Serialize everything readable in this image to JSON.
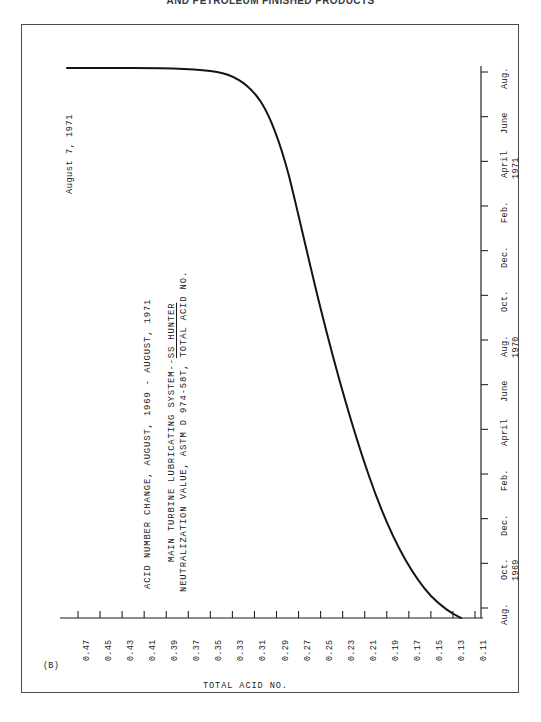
{
  "document": {
    "header": "AND PETROLEUM FINISHED PRODUCTS",
    "frame_color": "#4b4b53"
  },
  "figure": {
    "corner_code": "(B)",
    "annotation": "August 7, 1971",
    "title_lines": [
      "ACID NUMBER CHANGE, AUGUST, 1969 - AUGUST, 1971",
      "MAIN TURBINE LUBRICATING SYSTEM--SS HUNTER",
      "NEUTRALIZATION VALUE, ASTM D 974-58T, TOTAL ACID NO."
    ],
    "title_underlined_segment": "SS HUNTER",
    "value_axis_label": "TOTAL ACID NO.",
    "curve_color": "#141414",
    "axis_color": "#1b1b1b"
  },
  "chart_data": {
    "type": "line",
    "title": "ACID NUMBER CHANGE, AUGUST, 1969 - AUGUST, 1971",
    "subtitle": "MAIN TURBINE LUBRICATING SYSTEM--SS HUNTER",
    "method": "NEUTRALIZATION VALUE, ASTM D 974-58T, TOTAL ACID NO.",
    "orientation": "rotated-landscape",
    "xlabel": "TOTAL ACID NO.",
    "ylabel": "",
    "grid": false,
    "legend": null,
    "value_axis": {
      "name": "TOTAL ACID NO.",
      "ticks": [
        "0.47",
        "0.45",
        "0.43",
        "0.41",
        "0.39",
        "0.37",
        "0.35",
        "0.33",
        "0.31",
        "0.29",
        "0.27",
        "0.25",
        "0.23",
        "0.21",
        "0.19",
        "0.17",
        "0.15",
        "0.13",
        "0.11"
      ],
      "min": 0.11,
      "max": 0.47,
      "step": 0.02,
      "direction": "decreasing-left-to-right"
    },
    "time_axis": {
      "name": "Date",
      "ticks": [
        "Aug.",
        "Oct.",
        "Dec.",
        "Feb.",
        "April",
        "June",
        "Aug.",
        "Oct.",
        "Dec.",
        "Feb.",
        "April",
        "June",
        "Aug."
      ],
      "year_markers": [
        {
          "label": "1969",
          "at_tick": "Oct."
        },
        {
          "label": "1970",
          "at_tick": "Aug."
        },
        {
          "label": "1971",
          "at_tick": "April"
        }
      ],
      "start": "Aug. 1969",
      "end": "Aug. 1971",
      "direction": "bottom-to-top"
    },
    "series": [
      {
        "name": "Total Acid No.",
        "points": [
          {
            "date": "Aug. 1969",
            "value": 0.11
          },
          {
            "date": "Oct. 1969",
            "value": 0.13
          },
          {
            "date": "Dec. 1969",
            "value": 0.145
          },
          {
            "date": "Feb. 1970",
            "value": 0.16
          },
          {
            "date": "April 1970",
            "value": 0.175
          },
          {
            "date": "June 1970",
            "value": 0.195
          },
          {
            "date": "Aug. 1970",
            "value": 0.215
          },
          {
            "date": "Oct. 1970",
            "value": 0.235
          },
          {
            "date": "Dec. 1970",
            "value": 0.255
          },
          {
            "date": "Feb. 1971",
            "value": 0.28
          },
          {
            "date": "April 1971",
            "value": 0.315
          },
          {
            "date": "June 1971",
            "value": 0.4
          },
          {
            "date": "Aug. 1971",
            "value": 0.455
          },
          {
            "date": "Aug. 7, 1971",
            "value": 0.465
          }
        ],
        "annotation": "August 7, 1971"
      }
    ]
  },
  "ticks": {
    "values": [
      "0.47",
      "0.45",
      "0.43",
      "0.41",
      "0.39",
      "0.37",
      "0.35",
      "0.33",
      "0.31",
      "0.29",
      "0.27",
      "0.25",
      "0.23",
      "0.21",
      "0.19",
      "0.17",
      "0.15",
      "0.13",
      "0.11"
    ],
    "dates": [
      "Aug.",
      "Oct.",
      "Dec.",
      "Feb.",
      "April",
      "June",
      "Aug.",
      "Oct.",
      "Dec.",
      "Feb.",
      "April",
      "June",
      "Aug."
    ],
    "years": [
      "1969",
      "1970",
      "1971"
    ]
  }
}
